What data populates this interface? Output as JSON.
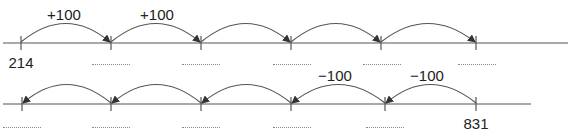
{
  "diagram": {
    "type": "number-line-exercise",
    "line1": {
      "start_label": "214",
      "step": "+100",
      "jump_labels": [
        "+100",
        "+100"
      ],
      "jumps": 5,
      "direction": "right",
      "blanks": 5
    },
    "line2": {
      "end_label": "831",
      "step": "−100",
      "jump_labels": [
        "−100",
        "−100"
      ],
      "jumps": 5,
      "direction": "left",
      "blanks": 5
    },
    "colors": {
      "line": "#555555",
      "text": "#222222",
      "blank": "#888888"
    }
  }
}
